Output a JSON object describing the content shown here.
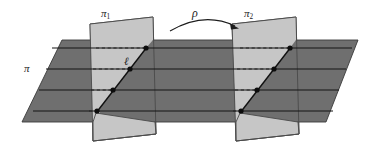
{
  "figure": {
    "type": "geometry-diagram",
    "background_color": "#ffffff",
    "colors": {
      "horizontal_plane_fill": "#6f6f6f",
      "vertical_plane_fill": "#c6c6c6",
      "outline": "#3a3a3a",
      "line": "#1c1c1c",
      "dashed": "#2a2a2a",
      "dot": "#111111",
      "label": "#1a1a1a"
    },
    "labels": {
      "plane_pi": "π",
      "plane_pi1_base": "π",
      "plane_pi1_sub": "1",
      "plane_pi2_base": "π",
      "plane_pi2_sub": "2",
      "rotation_rho": "ρ",
      "line_ell": "ℓ"
    },
    "geometry": {
      "horizontal_plane_points": "62,40 358,40 326,122 22,122",
      "pi1_points": "88,20 152,20 152,137 88,137",
      "pi1_skewed_points": "90,24 153,17 156,134 93,141",
      "pi2_points": "232,24 296,17 299,134 236,141",
      "horizontal_line_y": [
        48,
        69,
        90,
        111
      ],
      "horizontal_line_x_start": [
        52,
        46,
        39,
        33
      ],
      "horizontal_line_x_end": [
        352,
        346,
        339,
        333
      ],
      "pi1_diag_from": "96,113",
      "pi1_diag_to": "146,48",
      "pi2_diag_from": "240,113",
      "pi2_diag_to": "290,48",
      "dots_pi1": [
        [
          146,
          48
        ],
        [
          130,
          69
        ],
        [
          113,
          90
        ],
        [
          96,
          111
        ]
      ],
      "dots_pi2": [
        [
          290,
          48
        ],
        [
          274,
          69
        ],
        [
          257,
          90
        ],
        [
          240,
          111
        ]
      ],
      "arrow_path": "M 170 30 Q 205 12 238 27",
      "arrowhead": "238,27"
    }
  }
}
